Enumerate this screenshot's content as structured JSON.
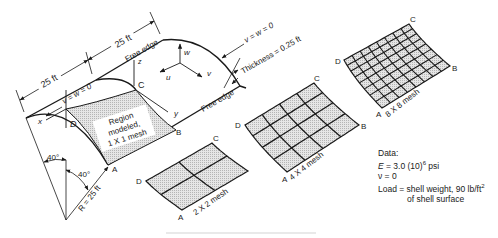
{
  "shell": {
    "dim_left": "25 ft",
    "dim_right": "25 ft",
    "free_edge_top": "Free edge",
    "free_edge_bottom": "Free edge",
    "bc_left": "v = w = 0",
    "bc_right": "v = w = 0",
    "thickness": "Thickness = 0.25 ft",
    "region_lines": [
      "Region",
      "modeled,",
      "1 X 1 mesh"
    ],
    "angle1": "40°",
    "angle2": "40°",
    "radius": "R = 25 ft",
    "axes": {
      "x": "x",
      "y": "y",
      "z": "z",
      "u": "u",
      "v": "v",
      "w": "w"
    },
    "corners": {
      "A": "A",
      "B": "B",
      "C": "C",
      "D": "D"
    }
  },
  "meshes": [
    {
      "label": "2 X 2 mesh",
      "n": 2,
      "corners": {
        "A": "A",
        "C": "C",
        "D": "D"
      }
    },
    {
      "label": "4 X 4 mesh",
      "n": 4,
      "corners": {
        "A": "A",
        "B": "B",
        "C": "C",
        "D": "D"
      }
    },
    {
      "label": "8 X 8 mesh",
      "n": 8,
      "corners": {
        "A": "A",
        "B": "B",
        "C": "C",
        "D": "D"
      }
    }
  ],
  "data": {
    "title": "Data:",
    "E": "E = 3.0 (10)",
    "E_exp": "6",
    "E_unit": " psi",
    "nu": "ν = 0",
    "load": "Load = shell weight, 90 lb/ft",
    "load_exp": "2",
    "load2": "of shell surface"
  }
}
